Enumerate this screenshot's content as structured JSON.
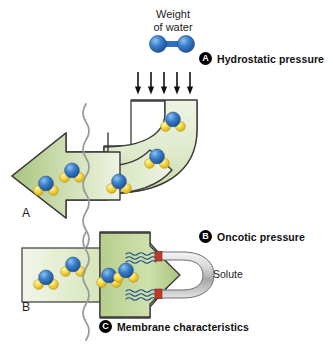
{
  "figure": {
    "title_caption": "Weight\nof water",
    "weight_line1": "Weight",
    "weight_line2": "of water",
    "panel_a_letter": "A",
    "panel_b_letter": "B",
    "solute_label": "Solute"
  },
  "legend": [
    {
      "marker": "A",
      "label": "Hydrostatic pressure"
    },
    {
      "marker": "B",
      "label": "Oncotic pressure"
    },
    {
      "marker": "C",
      "label": "Membrane characteristics"
    }
  ],
  "icons": {
    "water_molecule": "water-molecule-icon",
    "oxygen_molecule": "oxygen-molecule-icon",
    "down_arrow": "down-arrow-icon",
    "membrane": "wavy-membrane-icon",
    "magnet": "horseshoe-magnet-icon",
    "attraction_waves": "attraction-wave-icon"
  },
  "colors": {
    "flow_green_light": "#e8f0da",
    "flow_green_mid": "#b9cf92",
    "flow_green_dark": "#9cbb74",
    "outline": "#3a3a3a",
    "oxygen_blue": "#2f6fc0",
    "oxygen_blue_light": "#5b9ade",
    "hydrogen_yellow": "#f2d33f",
    "hydrogen_yellow_light": "#fbefa0",
    "membrane_gray": "#9a9a9a",
    "magnet_gray": "#c9c9c9",
    "magnet_tip_red": "#c0392b",
    "text_black": "#1a1a1a",
    "background": "#ffffff"
  },
  "structure": {
    "panel_a_name": "hydrostatic-pressure-panel",
    "panel_b_name": "oncotic-pressure-panel",
    "arrow_count_down": 5,
    "molecules_in_panel_a": 6,
    "molecules_in_panel_b": 4,
    "attraction_wave_groups": 2
  }
}
